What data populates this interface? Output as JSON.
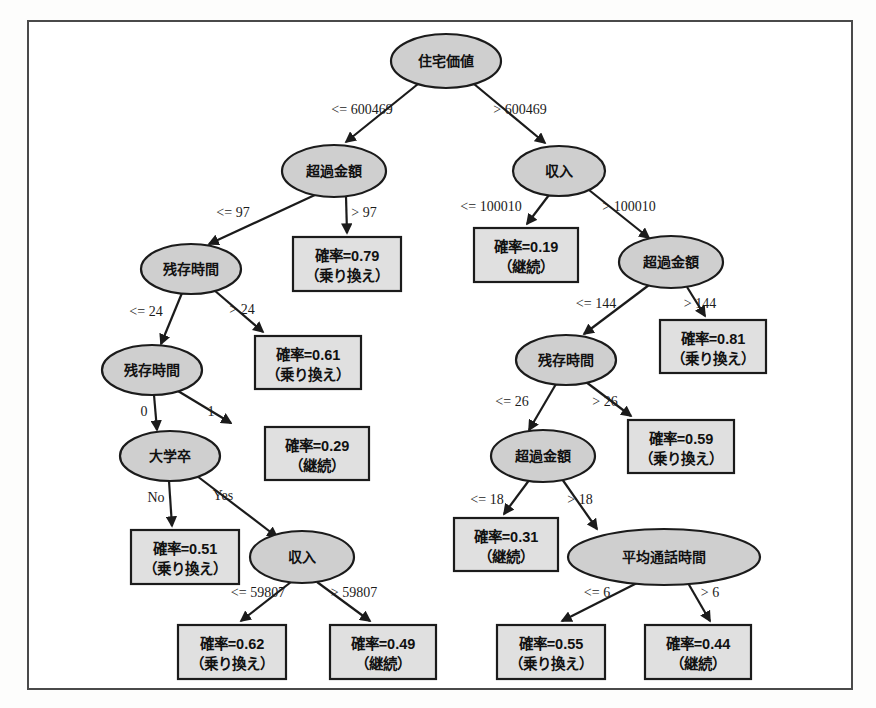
{
  "diagram": {
    "type": "decision-tree",
    "title": "",
    "colors": {
      "node_fill": "#cfcfcf",
      "leaf_fill": "#e0e0e0",
      "stroke": "#1b1b1b",
      "frame": "#4a4a4a",
      "background": "#ffffff"
    },
    "nodes": [
      {
        "id": "n0",
        "label": "住宅価値",
        "kind": "decision",
        "cx": 446,
        "cy": 61,
        "rx": 55,
        "ry": 27
      },
      {
        "id": "n1",
        "label": "超過金額",
        "kind": "decision",
        "cx": 334,
        "cy": 171,
        "rx": 52,
        "ry": 26
      },
      {
        "id": "n2",
        "label": "収入",
        "kind": "decision",
        "cx": 559,
        "cy": 171,
        "rx": 46,
        "ry": 25
      },
      {
        "id": "n3",
        "label": "残存時間",
        "kind": "decision",
        "cx": 191,
        "cy": 269,
        "rx": 50,
        "ry": 25
      },
      {
        "id": "L1",
        "label": "確率=0.79",
        "label2": "（乗り換え）",
        "kind": "leaf",
        "x": 293,
        "y": 237,
        "w": 108,
        "h": 54
      },
      {
        "id": "L2",
        "label": "確率=0.19",
        "label2": "（継続）",
        "kind": "leaf",
        "x": 474,
        "y": 228,
        "w": 104,
        "h": 54
      },
      {
        "id": "n4",
        "label": "超過金額",
        "kind": "decision",
        "cx": 671,
        "cy": 262,
        "rx": 52,
        "ry": 26
      },
      {
        "id": "n5",
        "label": "残存時間",
        "kind": "decision",
        "cx": 152,
        "cy": 370,
        "rx": 50,
        "ry": 25
      },
      {
        "id": "L3",
        "label": "確率=0.61",
        "label2": "（乗り換え）",
        "kind": "leaf",
        "x": 255,
        "y": 336,
        "w": 106,
        "h": 53
      },
      {
        "id": "n6",
        "label": "残存時間",
        "kind": "decision",
        "cx": 566,
        "cy": 360,
        "rx": 50,
        "ry": 25
      },
      {
        "id": "L4",
        "label": "確率=0.81",
        "label2": "（乗り換え）",
        "kind": "leaf",
        "x": 660,
        "y": 320,
        "w": 106,
        "h": 53
      },
      {
        "id": "n7",
        "label": "大学卒",
        "kind": "decision",
        "cx": 170,
        "cy": 456,
        "rx": 50,
        "ry": 25
      },
      {
        "id": "L5",
        "label": "確率=0.29",
        "label2": "（継続）",
        "kind": "leaf",
        "x": 265,
        "y": 427,
        "w": 104,
        "h": 53
      },
      {
        "id": "n8",
        "label": "超過金額",
        "kind": "decision",
        "cx": 543,
        "cy": 456,
        "rx": 52,
        "ry": 26
      },
      {
        "id": "L6",
        "label": "確率=0.59",
        "label2": "（乗り換え）",
        "kind": "leaf",
        "x": 628,
        "y": 420,
        "w": 106,
        "h": 53
      },
      {
        "id": "L7",
        "label": "確率=0.51",
        "label2": "（乗り換え）",
        "kind": "leaf",
        "x": 131,
        "y": 530,
        "w": 108,
        "h": 54
      },
      {
        "id": "n9",
        "label": "収入",
        "kind": "decision",
        "cx": 302,
        "cy": 557,
        "rx": 52,
        "ry": 26
      },
      {
        "id": "L8",
        "label": "確率=0.31",
        "label2": "（継続）",
        "kind": "leaf",
        "x": 454,
        "y": 518,
        "w": 104,
        "h": 53
      },
      {
        "id": "n10",
        "label": "平均通話時間",
        "kind": "decision",
        "cx": 664,
        "cy": 557,
        "rx": 96,
        "ry": 28
      },
      {
        "id": "L9",
        "label": "確率=0.62",
        "label2": "（乗り換え）",
        "kind": "leaf",
        "x": 178,
        "y": 625,
        "w": 108,
        "h": 54
      },
      {
        "id": "L10",
        "label": "確率=0.49",
        "label2": "（継続）",
        "kind": "leaf",
        "x": 330,
        "y": 625,
        "w": 106,
        "h": 54
      },
      {
        "id": "L11",
        "label": "確率=0.55",
        "label2": "（乗り換え）",
        "kind": "leaf",
        "x": 497,
        "y": 625,
        "w": 108,
        "h": 54
      },
      {
        "id": "L12",
        "label": "確率=0.44",
        "label2": "（継続）",
        "kind": "leaf",
        "x": 645,
        "y": 625,
        "w": 106,
        "h": 54
      }
    ],
    "edges": [
      {
        "id": "e0",
        "from": "n0",
        "to": "n1",
        "label": "<= 600469",
        "lx": 362,
        "ly": 114,
        "x1": 418,
        "y1": 84,
        "x2": 346,
        "y2": 142
      },
      {
        "id": "e1",
        "from": "n0",
        "to": "n2",
        "label": "> 600469",
        "lx": 520,
        "ly": 114,
        "x1": 474,
        "y1": 84,
        "x2": 545,
        "y2": 143
      },
      {
        "id": "e2",
        "from": "n1",
        "to": "n3",
        "label": "<= 97",
        "lx": 233,
        "ly": 217,
        "x1": 317,
        "y1": 194,
        "x2": 209,
        "y2": 244
      },
      {
        "id": "e3",
        "from": "n1",
        "to": "L1",
        "label": "> 97",
        "lx": 364,
        "ly": 217,
        "x1": 346,
        "y1": 196,
        "x2": 347,
        "y2": 233
      },
      {
        "id": "e4",
        "from": "n2",
        "to": "L2",
        "label": "<= 100010",
        "lx": 491,
        "ly": 211,
        "x1": 549,
        "y1": 195,
        "x2": 527,
        "y2": 224
      },
      {
        "id": "e5",
        "from": "n2",
        "to": "n4",
        "label": "> 100010",
        "lx": 629,
        "ly": 211,
        "x1": 589,
        "y1": 190,
        "x2": 649,
        "y2": 238
      },
      {
        "id": "e6",
        "from": "n3",
        "to": "n5",
        "label": "<= 24",
        "lx": 146,
        "ly": 316,
        "x1": 182,
        "y1": 293,
        "x2": 161,
        "y2": 344
      },
      {
        "id": "e7",
        "from": "n3",
        "to": "L3",
        "label": "> 24",
        "lx": 242,
        "ly": 314,
        "x1": 214,
        "y1": 290,
        "x2": 263,
        "y2": 332
      },
      {
        "id": "e8",
        "from": "n4",
        "to": "n6",
        "label": "<= 144",
        "lx": 596,
        "ly": 308,
        "x1": 649,
        "y1": 285,
        "x2": 584,
        "y2": 334
      },
      {
        "id": "e9",
        "from": "n4",
        "to": "L4",
        "label": "> 144",
        "lx": 700,
        "ly": 308,
        "x1": 687,
        "y1": 287,
        "x2": 705,
        "y2": 316
      },
      {
        "id": "e10",
        "from": "n5",
        "to": "n7",
        "label": "0",
        "lx": 144,
        "ly": 416,
        "x1": 154,
        "y1": 395,
        "x2": 157,
        "y2": 430
      },
      {
        "id": "e11",
        "from": "n5",
        "to": "L5",
        "label": "1",
        "lx": 211,
        "ly": 416,
        "x1": 178,
        "y1": 391,
        "x2": 231,
        "y2": 423
      },
      {
        "id": "e12",
        "from": "n6",
        "to": "n8",
        "label": "<= 26",
        "lx": 512,
        "ly": 406,
        "x1": 556,
        "y1": 384,
        "x2": 529,
        "y2": 430
      },
      {
        "id": "e13",
        "from": "n6",
        "to": "L6",
        "label": "> 26",
        "lx": 605,
        "ly": 406,
        "x1": 586,
        "y1": 382,
        "x2": 631,
        "y2": 416
      },
      {
        "id": "e14",
        "from": "n7",
        "to": "L7",
        "label": "No",
        "lx": 156,
        "ly": 502,
        "x1": 169,
        "y1": 481,
        "x2": 172,
        "y2": 526
      },
      {
        "id": "e15",
        "from": "n7",
        "to": "n9",
        "label": "Yes",
        "lx": 223,
        "ly": 500,
        "x1": 197,
        "y1": 476,
        "x2": 277,
        "y2": 537
      },
      {
        "id": "e16",
        "from": "n8",
        "to": "L8",
        "label": "<= 18",
        "lx": 487,
        "ly": 504,
        "x1": 530,
        "y1": 479,
        "x2": 504,
        "y2": 514
      },
      {
        "id": "e17",
        "from": "n8",
        "to": "n10",
        "label": "> 18",
        "lx": 580,
        "ly": 504,
        "x1": 562,
        "y1": 479,
        "x2": 597,
        "y2": 529
      },
      {
        "id": "e18",
        "from": "n9",
        "to": "L9",
        "label": "<= 59807",
        "lx": 258,
        "ly": 597,
        "x1": 291,
        "y1": 582,
        "x2": 241,
        "y2": 621
      },
      {
        "id": "e19",
        "from": "n9",
        "to": "L10",
        "label": "> 59807",
        "lx": 354,
        "ly": 597,
        "x1": 317,
        "y1": 582,
        "x2": 370,
        "y2": 621
      },
      {
        "id": "e20",
        "from": "n10",
        "to": "L11",
        "label": "<= 6",
        "lx": 597,
        "ly": 597,
        "x1": 637,
        "y1": 583,
        "x2": 562,
        "y2": 621
      },
      {
        "id": "e21",
        "from": "n10",
        "to": "L12",
        "label": "> 6",
        "lx": 710,
        "ly": 597,
        "x1": 688,
        "y1": 583,
        "x2": 710,
        "y2": 621
      }
    ]
  }
}
